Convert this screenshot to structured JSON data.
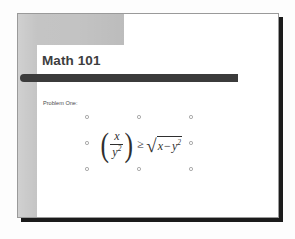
{
  "application": {
    "view": "slide-editor-canvas",
    "canvas_background": "#fdfdfd"
  },
  "slide": {
    "title": "Math 101",
    "body_label": "Problem One:",
    "decoration": {
      "block_color": "#c3c3c3",
      "rule_bar_color": "#3b3b3b",
      "panel_color": "#ffffff",
      "border_color": "#9a9a9a",
      "shadow_color": "#1b1b1b"
    },
    "equation_object": {
      "name": "equation-object",
      "selected": true,
      "latex": "\\left(\\frac{x}{y^{2}}\\right) \\geq \\sqrt{x - y^{2}}",
      "plain_text": "( x / y^2 ) >= sqrt( x - y^2 )",
      "parts": {
        "open_paren": "(",
        "numerator": "x",
        "denominator_base": "y",
        "denominator_exponent": "2",
        "close_paren": ")",
        "relation": "≥",
        "radical_sign": "√",
        "radicand_first": "x",
        "radicand_operator": "−",
        "radicand_second_base": "y",
        "radicand_second_exponent": "2"
      },
      "handles": [
        {
          "name": "handle-top-left",
          "x": 0,
          "y": 0
        },
        {
          "name": "handle-top-center",
          "x": 52,
          "y": 0
        },
        {
          "name": "handle-top-right",
          "x": 104,
          "y": 0
        },
        {
          "name": "handle-middle-left",
          "x": 0,
          "y": 26
        },
        {
          "name": "handle-middle-right",
          "x": 104,
          "y": 26
        },
        {
          "name": "handle-bottom-left",
          "x": 0,
          "y": 52
        },
        {
          "name": "handle-bottom-center",
          "x": 52,
          "y": 52
        },
        {
          "name": "handle-bottom-right",
          "x": 104,
          "y": 52
        }
      ]
    }
  }
}
